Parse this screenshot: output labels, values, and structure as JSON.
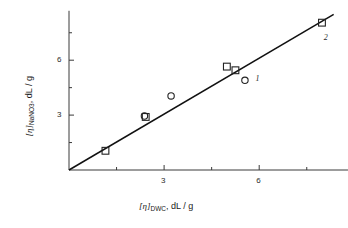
{
  "chart_data": {
    "type": "scatter",
    "title": "",
    "xlabel": "[η]DWC , dL / g",
    "ylabel": "[η]NaNO3 , dL / g",
    "xlabel_parts": {
      "bracket_open": "[",
      "eta": "η",
      "bracket_close": "]",
      "subscript": "DWC",
      "units": ", dL / g"
    },
    "ylabel_parts": {
      "bracket_open": "[",
      "eta": "η",
      "bracket_close": "]",
      "subscript": "NaNO",
      "subscript_number": "3",
      "units": ", dL / g"
    },
    "xlim": [
      0,
      8.8
    ],
    "ylim": [
      0,
      8.7
    ],
    "grid": false,
    "legend": "none",
    "x_major_ticks": [
      3,
      6
    ],
    "x_minor_ticks": [
      1.5,
      4.5,
      7.5
    ],
    "y_major_ticks": [
      3,
      6
    ],
    "y_minor_ticks": [
      1.5,
      4.5,
      7.5
    ],
    "x_tick_labels": [
      "3",
      "6"
    ],
    "y_tick_labels": [
      "3",
      "6"
    ],
    "fit_line": {
      "x0": 0,
      "y0": 0,
      "x1": 8.35,
      "y1": 8.5,
      "slope": 1.02,
      "intercept": 0
    },
    "series": [
      {
        "name": "squares",
        "marker": "open-square",
        "points": [
          {
            "x": 1.15,
            "y": 1.05
          },
          {
            "x": 2.42,
            "y": 2.9
          },
          {
            "x": 4.98,
            "y": 5.65
          },
          {
            "x": 5.25,
            "y": 5.45
          },
          {
            "x": 7.98,
            "y": 8.05
          }
        ]
      },
      {
        "name": "circles",
        "marker": "open-circle",
        "points": [
          {
            "x": 2.38,
            "y": 2.95
          },
          {
            "x": 3.22,
            "y": 4.05
          },
          {
            "x": 5.55,
            "y": 4.9
          }
        ]
      }
    ],
    "annotations": [
      {
        "text": "1",
        "x": 5.95,
        "y": 4.95
      },
      {
        "text": "2",
        "x": 8.1,
        "y": 7.2
      }
    ]
  }
}
